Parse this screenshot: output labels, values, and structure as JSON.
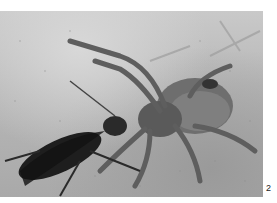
{
  "figure": {
    "label": "2"
  }
}
